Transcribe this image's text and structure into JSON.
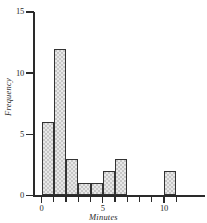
{
  "chart_data": {
    "type": "bar",
    "title": "",
    "subtitle": "",
    "xlabel": "Minutes",
    "ylabel": "Frequency",
    "xlim": [
      -1,
      12
    ],
    "ylim": [
      0,
      15
    ],
    "grid": false,
    "legend": null,
    "bin_width": 1,
    "categories": [
      "0-1",
      "1-2",
      "2-3",
      "3-4",
      "4-5",
      "5-6",
      "6-7",
      "10-11"
    ],
    "bin_starts": [
      0,
      1,
      2,
      3,
      4,
      5,
      6,
      10
    ],
    "values": [
      6,
      12,
      3,
      1,
      1,
      2,
      3,
      2
    ],
    "x_ticks": [
      {
        "value": 0,
        "label": "0",
        "major": true
      },
      {
        "value": 1,
        "label": "",
        "major": false
      },
      {
        "value": 2,
        "label": "",
        "major": false
      },
      {
        "value": 3,
        "label": "",
        "major": false
      },
      {
        "value": 4,
        "label": "",
        "major": false
      },
      {
        "value": 5,
        "label": "5",
        "major": true
      },
      {
        "value": 6,
        "label": "",
        "major": false
      },
      {
        "value": 7,
        "label": "",
        "major": false
      },
      {
        "value": 8,
        "label": "",
        "major": false
      },
      {
        "value": 9,
        "label": "",
        "major": false
      },
      {
        "value": 10,
        "label": "10",
        "major": true
      },
      {
        "value": 11,
        "label": "",
        "major": false
      }
    ],
    "y_ticks": [
      {
        "value": 0,
        "label": "0"
      },
      {
        "value": 5,
        "label": "5"
      },
      {
        "value": 10,
        "label": "10"
      },
      {
        "value": 15,
        "label": "15"
      }
    ],
    "style": {
      "bar_fill": "#e8e8e8",
      "bar_pattern": "dotted-stipple",
      "bar_edge": "#333333",
      "axis_color": "#2a2a2a",
      "background": "#ffffff"
    }
  }
}
